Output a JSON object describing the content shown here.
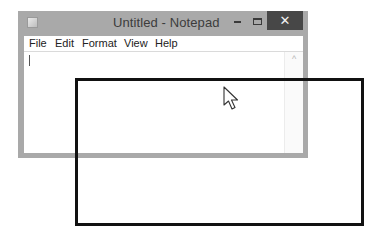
{
  "window": {
    "title": "Untitled - Notepad",
    "icon": "notepad-app-icon",
    "controls": {
      "minimize_icon": "minimize-icon",
      "maximize_icon": "maximize-icon",
      "close_glyph": "✕"
    }
  },
  "menu": {
    "items": [
      {
        "label": "File"
      },
      {
        "label": "Edit"
      },
      {
        "label": "Format"
      },
      {
        "label": "View"
      },
      {
        "label": "Help"
      }
    ]
  },
  "editor": {
    "content": ""
  },
  "scrollbar": {
    "up_glyph": "^"
  },
  "overlay": {
    "selection_rect_color": "#111111",
    "close_button_color": "#474747",
    "frame_color": "#a9a9a9"
  }
}
